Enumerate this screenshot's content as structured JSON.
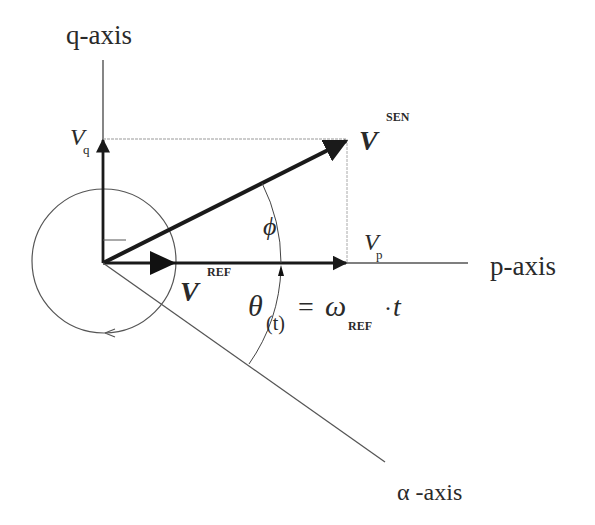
{
  "diagram": {
    "type": "vector-phasor-diagram",
    "axes": {
      "q": "q-axis",
      "p": "p-axis",
      "alpha": "α -axis"
    },
    "vectors": {
      "sen": {
        "base": "V",
        "sup": "SEN"
      },
      "ref": {
        "base": "V",
        "sup": "REF"
      },
      "vq": {
        "base": "V",
        "sub": "q"
      },
      "vp": {
        "base": "V",
        "sub": "p"
      }
    },
    "angles": {
      "phi": "ϕ",
      "theta_lhs": "θ",
      "theta_sub": "(t)",
      "equals": "=",
      "omega": "ω",
      "omega_sub": "REF",
      "dot": "·",
      "t": "t"
    },
    "colors": {
      "line": "#2a2a2a",
      "thin": "#555555",
      "dashed": "#888888",
      "background": "#ffffff"
    }
  }
}
